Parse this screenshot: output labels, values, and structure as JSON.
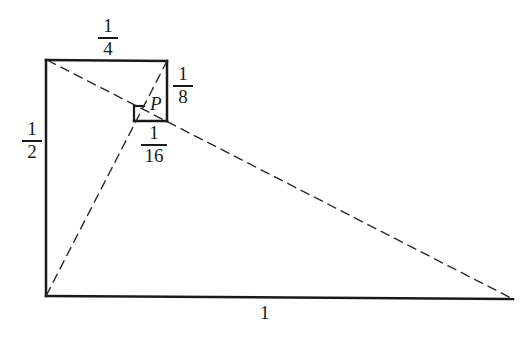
{
  "diagram": {
    "colors": {
      "stroke": "#1a1a1a",
      "background": "#ffffff"
    },
    "labels": {
      "top": {
        "numerator": "1",
        "denominator": "4"
      },
      "right_small": {
        "numerator": "1",
        "denominator": "8"
      },
      "left": {
        "numerator": "1",
        "denominator": "2"
      },
      "bottom_small": {
        "numerator": "1",
        "denominator": "16"
      },
      "point": "P",
      "base": "1"
    },
    "segments": {
      "solid": [
        {
          "name": "left-side",
          "from": [
            46,
            60
          ],
          "to": [
            46,
            296
          ]
        },
        {
          "name": "base",
          "from": [
            46,
            296
          ],
          "to": [
            513,
            299
          ]
        },
        {
          "name": "top-quarter",
          "from": [
            46,
            60
          ],
          "to": [
            167,
            61
          ]
        },
        {
          "name": "eighth-side",
          "from": [
            167,
            61
          ],
          "to": [
            167,
            121
          ]
        },
        {
          "name": "sixteenth-side",
          "from": [
            134,
            121
          ],
          "to": [
            167,
            121
          ]
        },
        {
          "name": "small-square-left",
          "from": [
            134,
            106
          ],
          "to": [
            134,
            121
          ]
        },
        {
          "name": "small-square-top",
          "from": [
            134,
            106
          ],
          "to": [
            144,
            106
          ]
        }
      ],
      "dashed": [
        {
          "name": "diagonal-long",
          "from": [
            47,
            60
          ],
          "to": [
            513,
            299
          ]
        },
        {
          "name": "diagonal-steep",
          "from": [
            46,
            296
          ],
          "to": [
            167,
            61
          ]
        }
      ]
    }
  }
}
